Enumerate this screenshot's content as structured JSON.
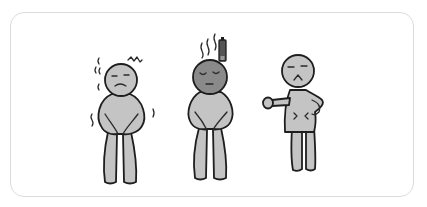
{
  "illustration": {
    "description": "Three cartoon stick figures showing physical discomfort",
    "colors": {
      "background": "#ffffff",
      "card_border": "#dcdcdc",
      "body_light": "#c4c4c4",
      "body_dark": "#8a8a8a",
      "ink": "#1e1e1e"
    },
    "figures": [
      {
        "id": "cold",
        "label": "shivering figure",
        "expression": "frowning",
        "marks": [
          "shiver-lines",
          "zigzag"
        ]
      },
      {
        "id": "tired",
        "label": "exhausted figure",
        "expression": "eyes-closed",
        "marks": [
          "steam-lines",
          "low-battery"
        ]
      },
      {
        "id": "stomach",
        "label": "stomach ache figure",
        "expression": "grimacing",
        "marks": [
          "pain-marks"
        ]
      }
    ]
  }
}
